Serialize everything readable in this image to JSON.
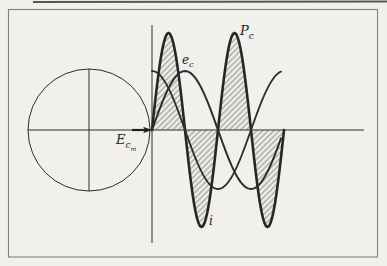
{
  "figure": {
    "kind": "textbook waveform diagram",
    "paper_color": "#f2f0ec",
    "ink_color": "#2d2d2d",
    "frame_color": "#82817b"
  },
  "labels": {
    "power_curve": {
      "main": "P",
      "sub": "c"
    },
    "voltage_curve": {
      "main": "e",
      "sub": "c"
    },
    "current_curve": {
      "main": "i"
    },
    "phasor": {
      "main": "E",
      "sub": "c",
      "subsub": "m"
    }
  },
  "chart_data": {
    "type": "line",
    "title": "",
    "xlabel": "",
    "ylabel": "",
    "axes_labeled": false,
    "grid": false,
    "x_range_cycles": [
      0,
      1
    ],
    "series": [
      {
        "name": "e_c",
        "shape": "sine",
        "phase_deg": 0,
        "relative_amplitude": 1.0,
        "style": "medium line"
      },
      {
        "name": "i",
        "shape": "cosine, leads e_c by 90 degrees",
        "phase_deg": 90,
        "relative_amplitude": 1.0,
        "style": "medium line, ends just before second maximum"
      },
      {
        "name": "P_c",
        "shape": "double frequency product of e_c and i, four alternating lobes starting positive",
        "phase_deg": 0,
        "relative_amplitude": 1.64,
        "style": "heavy line, lobes hatched"
      }
    ]
  },
  "geometry": {
    "origin_x": 152,
    "axis_y": 130,
    "wave_amplitude": 59,
    "power_amplitude": 97,
    "period_px": 132,
    "wave_end_x": 282,
    "power_end_x": 284
  }
}
